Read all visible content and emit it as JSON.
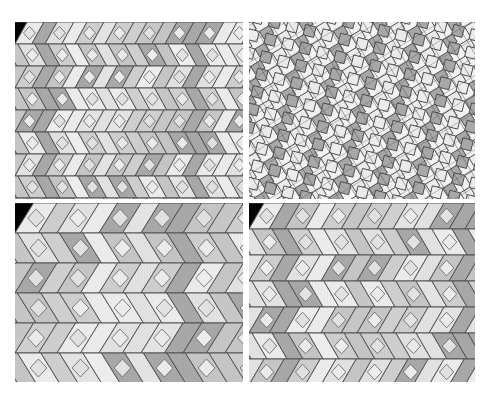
{
  "figure": {
    "title": "",
    "background_color": "#ffffff",
    "width": 490,
    "height": 403,
    "layout": "2x2 grid of tiling pattern panels",
    "gap_color": "#ffffff",
    "vertical_gap_px": 6,
    "horizontal_gap_px": 4
  },
  "palette": {
    "light": "#ededed",
    "light_alt": "#e3e3e3",
    "medium": "#cfcfcf",
    "medium_alt": "#c6c6c6",
    "dark": "#a8a8a8",
    "dark_alt": "#9e9e9e",
    "outline": "#4a4a4a",
    "outline_soft": "#6e6e6e",
    "panel_background": "#f2f2f2",
    "hatch": "#8c8c8c"
  },
  "panels": [
    {
      "id": "top-left",
      "name": "tiling-panel-top-left",
      "label": "",
      "pattern_type": "interlocking-rhombus-band",
      "band_height": 22,
      "band_count": 8,
      "unit_width": 30,
      "shear": 0.55,
      "tile_shapes": [
        "rhombus",
        "hexagon",
        "parallelogram"
      ],
      "tone_sequence": [
        "light",
        "medium",
        "dark",
        "light_alt",
        "medium_alt"
      ],
      "hatched": true,
      "rotation_deg": 0
    },
    {
      "id": "top-right",
      "name": "tiling-panel-top-right",
      "label": "",
      "pattern_type": "fine-crosshatch-diamond",
      "band_height": 13,
      "band_count": 14,
      "unit_width": 18,
      "shear": 0.85,
      "tile_shapes": [
        "square",
        "rhombus",
        "parallelogram"
      ],
      "tone_sequence": [
        "light",
        "medium",
        "dark",
        "medium_alt"
      ],
      "hatched": true,
      "rotation_deg": 14
    },
    {
      "id": "bottom-left",
      "name": "tiling-panel-bottom-left",
      "label": "",
      "pattern_type": "coarse-interlocking-rhombus",
      "band_height": 30,
      "band_count": 6,
      "unit_width": 42,
      "shear": 0.62,
      "tile_shapes": [
        "rhombus",
        "hexagon",
        "parallelogram"
      ],
      "tone_sequence": [
        "light",
        "dark",
        "medium",
        "light_alt",
        "medium_alt"
      ],
      "hatched": true,
      "rotation_deg": 0
    },
    {
      "id": "bottom-right",
      "name": "tiling-panel-bottom-right",
      "label": "",
      "pattern_type": "interlocking-rhombus-band",
      "band_height": 26,
      "band_count": 7,
      "unit_width": 36,
      "shear": 0.58,
      "tile_shapes": [
        "rhombus",
        "hexagon",
        "parallelogram"
      ],
      "tone_sequence": [
        "light",
        "medium",
        "dark",
        "medium_alt",
        "light_alt"
      ],
      "hatched": true,
      "rotation_deg": 0
    }
  ]
}
